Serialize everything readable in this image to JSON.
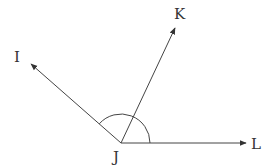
{
  "diagram": {
    "type": "angle-rays",
    "vertex": {
      "label": "J",
      "x": 121,
      "y": 143,
      "label_x": 113,
      "label_y": 162
    },
    "rays": [
      {
        "label": "I",
        "tip_x": 31,
        "tip_y": 64,
        "label_x": 14,
        "label_y": 62
      },
      {
        "label": "K",
        "tip_x": 175,
        "tip_y": 28,
        "label_x": 174,
        "label_y": 19
      },
      {
        "label": "L",
        "tip_x": 246,
        "tip_y": 143,
        "label_x": 251,
        "label_y": 149
      }
    ],
    "arc": {
      "radius": 29,
      "from": "L",
      "to": "I"
    },
    "stroke_color": "#444444"
  }
}
